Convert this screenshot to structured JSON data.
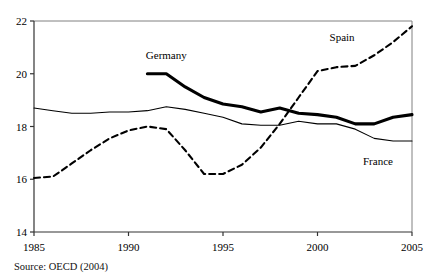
{
  "chart_data": {
    "type": "line",
    "title": "",
    "subtitle": "",
    "xlabel": "",
    "ylabel": "",
    "xlim": [
      1985,
      2005
    ],
    "ylim": [
      14,
      22
    ],
    "grid": false,
    "legend_position": "inline-annotations",
    "xticks": [
      1985,
      1990,
      1995,
      2000,
      2005
    ],
    "xtick_labels": [
      "1985",
      "1990",
      "1995",
      "2000",
      "2005"
    ],
    "yticks": [
      14,
      16,
      18,
      20,
      22
    ],
    "ytick_labels": [
      "14",
      "16",
      "18",
      "20",
      "22"
    ],
    "x": [
      1985,
      1986,
      1987,
      1988,
      1989,
      1990,
      1991,
      1992,
      1993,
      1994,
      1995,
      1996,
      1997,
      1998,
      1999,
      2000,
      2001,
      2002,
      2003,
      2004,
      2005
    ],
    "series": [
      {
        "name": "Germany",
        "style": "thick-solid",
        "color": "#000000",
        "x": [
          1991,
          1992,
          1993,
          1994,
          1995,
          1996,
          1997,
          1998,
          1999,
          2000,
          2001,
          2002,
          2003,
          2004,
          2005
        ],
        "values": [
          20.0,
          20.0,
          19.5,
          19.1,
          18.85,
          18.75,
          18.55,
          18.7,
          18.5,
          18.45,
          18.35,
          18.1,
          18.1,
          18.35,
          18.45
        ]
      },
      {
        "name": "Spain",
        "style": "dashed",
        "color": "#000000",
        "x": [
          1985,
          1986,
          1987,
          1988,
          1989,
          1990,
          1991,
          1992,
          1993,
          1994,
          1995,
          1996,
          1997,
          1998,
          1999,
          2000,
          2001,
          2002,
          2003,
          2004,
          2005
        ],
        "values": [
          16.05,
          16.1,
          16.6,
          17.1,
          17.55,
          17.85,
          18.0,
          17.9,
          17.1,
          16.2,
          16.2,
          16.55,
          17.2,
          18.1,
          19.1,
          20.1,
          20.25,
          20.3,
          20.7,
          21.2,
          21.8
        ]
      },
      {
        "name": "France",
        "style": "thin-solid",
        "color": "#000000",
        "x": [
          1985,
          1986,
          1987,
          1988,
          1989,
          1990,
          1991,
          1992,
          1993,
          1994,
          1995,
          1996,
          1997,
          1998,
          1999,
          2000,
          2001,
          2002,
          2003,
          2004,
          2005
        ],
        "values": [
          18.7,
          18.6,
          18.5,
          18.5,
          18.55,
          18.55,
          18.6,
          18.75,
          18.65,
          18.5,
          18.35,
          18.1,
          18.05,
          18.05,
          18.2,
          18.1,
          18.1,
          17.9,
          17.55,
          17.45,
          17.45
        ]
      }
    ],
    "annotations": [
      {
        "text": "Germany",
        "x": 1992.0,
        "y": 20.55
      },
      {
        "text": "Spain",
        "x": 2001.3,
        "y": 21.25
      },
      {
        "text": "France",
        "x": 2003.2,
        "y": 16.55
      }
    ]
  },
  "source": {
    "note": "Source: OECD (2004)"
  }
}
